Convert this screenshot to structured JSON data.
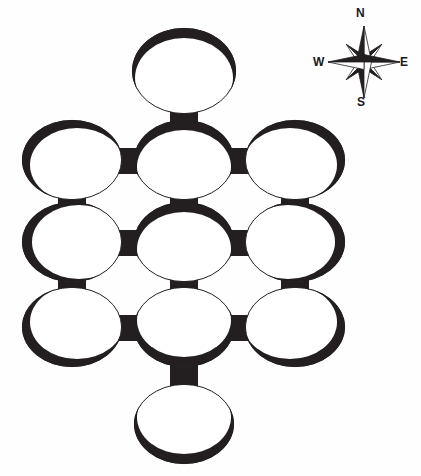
{
  "figure": {
    "type": "site-plan-diagram",
    "background_color": "#fefefe",
    "ink_color": "#231f20",
    "width": 421,
    "height": 476
  },
  "compass": {
    "name": "compass-rose",
    "center_x": 364,
    "center_y": 62,
    "star_points": 8,
    "labels": {
      "north": "N",
      "south": "S",
      "west": "W",
      "east": "E"
    },
    "label_color": "#1a1a1a"
  },
  "plan": {
    "description": "Eleven circular chambers arranged as a three-by-three grid with one additional chamber projecting north from the top-centre chamber and one projecting south from the bottom-centre chamber, all joined by short rectangular passages.",
    "chamber_count": 11,
    "passage_count": 14,
    "ring_stroke": "#231f20",
    "fill": "#ffffff",
    "chambers": [
      {
        "id": "C-N",
        "label": "north-chamber",
        "cx": 184,
        "cy": 71,
        "rx": 52,
        "ry": 43,
        "heavy": "top"
      },
      {
        "id": "C-NW",
        "label": "north-west-chamber",
        "cx": 72,
        "cy": 160,
        "rx": 50,
        "ry": 40,
        "heavy": "top-left"
      },
      {
        "id": "C-NC",
        "label": "north-centre-chamber",
        "cx": 184,
        "cy": 160,
        "rx": 50,
        "ry": 40,
        "heavy": "top"
      },
      {
        "id": "C-NE",
        "label": "north-east-chamber",
        "cx": 295,
        "cy": 160,
        "rx": 50,
        "ry": 40,
        "heavy": "top-right"
      },
      {
        "id": "C-MW",
        "label": "middle-west-chamber",
        "cx": 72,
        "cy": 242,
        "rx": 50,
        "ry": 40,
        "heavy": "left"
      },
      {
        "id": "C-MC",
        "label": "middle-centre-chamber",
        "cx": 184,
        "cy": 242,
        "rx": 50,
        "ry": 40,
        "heavy": "top"
      },
      {
        "id": "C-ME",
        "label": "middle-east-chamber",
        "cx": 295,
        "cy": 242,
        "rx": 50,
        "ry": 40,
        "heavy": "right"
      },
      {
        "id": "C-SW",
        "label": "south-west-chamber",
        "cx": 72,
        "cy": 327,
        "rx": 50,
        "ry": 40,
        "heavy": "bottom-left"
      },
      {
        "id": "C-SC",
        "label": "south-centre-chamber",
        "cx": 184,
        "cy": 327,
        "rx": 50,
        "ry": 40,
        "heavy": "bottom"
      },
      {
        "id": "C-SE",
        "label": "south-east-chamber",
        "cx": 295,
        "cy": 327,
        "rx": 50,
        "ry": 40,
        "heavy": "bottom-right"
      },
      {
        "id": "C-S",
        "label": "south-chamber",
        "cx": 184,
        "cy": 424,
        "rx": 50,
        "ry": 40,
        "heavy": "bottom"
      }
    ],
    "passages": [
      {
        "id": "P-01",
        "from": "C-N",
        "to": "C-NC",
        "orientation": "vertical"
      },
      {
        "id": "P-02",
        "from": "C-NW",
        "to": "C-NC",
        "orientation": "horizontal"
      },
      {
        "id": "P-03",
        "from": "C-NC",
        "to": "C-NE",
        "orientation": "horizontal"
      },
      {
        "id": "P-04",
        "from": "C-NW",
        "to": "C-MW",
        "orientation": "vertical"
      },
      {
        "id": "P-05",
        "from": "C-NC",
        "to": "C-MC",
        "orientation": "vertical"
      },
      {
        "id": "P-06",
        "from": "C-NE",
        "to": "C-ME",
        "orientation": "vertical"
      },
      {
        "id": "P-07",
        "from": "C-MW",
        "to": "C-MC",
        "orientation": "horizontal"
      },
      {
        "id": "P-08",
        "from": "C-MC",
        "to": "C-ME",
        "orientation": "horizontal"
      },
      {
        "id": "P-09",
        "from": "C-MW",
        "to": "C-SW",
        "orientation": "vertical"
      },
      {
        "id": "P-10",
        "from": "C-MC",
        "to": "C-SC",
        "orientation": "vertical"
      },
      {
        "id": "P-11",
        "from": "C-ME",
        "to": "C-SE",
        "orientation": "vertical"
      },
      {
        "id": "P-12",
        "from": "C-SW",
        "to": "C-SC",
        "orientation": "horizontal"
      },
      {
        "id": "P-13",
        "from": "C-SC",
        "to": "C-SE",
        "orientation": "horizontal"
      },
      {
        "id": "P-14",
        "from": "C-SC",
        "to": "C-S",
        "orientation": "vertical"
      }
    ]
  }
}
